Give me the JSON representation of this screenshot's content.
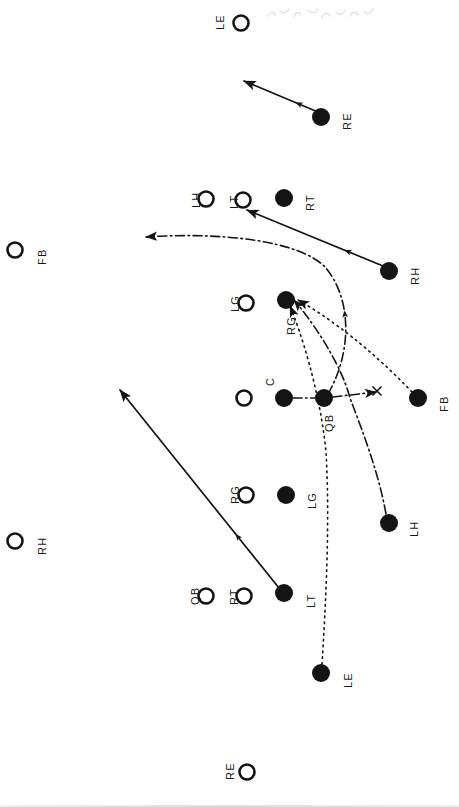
{
  "document": {
    "title": "Football Play Diagram",
    "orientation": "rotated-90",
    "background_color": "#ffffff",
    "ink_color": "#141414"
  },
  "legend": {
    "offense_marker": "filled-circle",
    "defense_marker": "open-circle"
  },
  "players": [
    {
      "id": "def-le-top",
      "label": "LE",
      "marker": "open",
      "cx": 241,
      "cy": 23,
      "r": 7.5,
      "label_x": 214,
      "label_y": 30
    },
    {
      "id": "off-re",
      "label": "RE",
      "marker": "filled",
      "cx": 321,
      "cy": 117,
      "r": 9,
      "label_x": 341,
      "label_y": 130
    },
    {
      "id": "def-lh",
      "label": "LH",
      "marker": "open",
      "cx": 206,
      "cy": 199,
      "r": 7.5,
      "label_x": 190,
      "label_y": 208
    },
    {
      "id": "def-lt",
      "label": "LT",
      "marker": "open",
      "cx": 243,
      "cy": 200,
      "r": 7.5,
      "label_x": 228,
      "label_y": 209
    },
    {
      "id": "off-rt",
      "label": "RT",
      "marker": "filled",
      "cx": 284,
      "cy": 198,
      "r": 9,
      "label_x": 304,
      "label_y": 211
    },
    {
      "id": "def-fb",
      "label": "FB",
      "marker": "open",
      "cx": 15,
      "cy": 250,
      "r": 7.5,
      "label_x": 36,
      "label_y": 265
    },
    {
      "id": "off-rh",
      "label": "RH",
      "marker": "filled",
      "cx": 389,
      "cy": 271,
      "r": 9,
      "label_x": 409,
      "label_y": 285
    },
    {
      "id": "def-lg",
      "label": "LG",
      "marker": "open",
      "cx": 246,
      "cy": 303,
      "r": 7.5,
      "label_x": 229,
      "label_y": 312
    },
    {
      "id": "off-rg",
      "label": "RG",
      "marker": "filled",
      "cx": 286,
      "cy": 300,
      "r": 9,
      "label_x": 285,
      "label_y": 335
    },
    {
      "id": "def-c",
      "label": "C",
      "marker": "open",
      "cx": 244,
      "cy": 398,
      "r": 7.5,
      "label_x": 264,
      "label_y": 386
    },
    {
      "id": "off-c",
      "label": "",
      "marker": "filled",
      "cx": 284,
      "cy": 398,
      "r": 9,
      "label_x": 0,
      "label_y": 0
    },
    {
      "id": "off-qb",
      "label": "QB",
      "marker": "filled",
      "cx": 324,
      "cy": 398,
      "r": 9,
      "label_x": 323,
      "label_y": 432
    },
    {
      "id": "off-fb",
      "label": "FB",
      "marker": "filled",
      "cx": 418,
      "cy": 398,
      "r": 9,
      "label_x": 438,
      "label_y": 412
    },
    {
      "id": "def-rh",
      "label": "RH",
      "marker": "open",
      "cx": 15,
      "cy": 541,
      "r": 7.5,
      "label_x": 36,
      "label_y": 555
    },
    {
      "id": "def-rg",
      "label": "RG",
      "marker": "open",
      "cx": 246,
      "cy": 495,
      "r": 7.5,
      "label_x": 229,
      "label_y": 504
    },
    {
      "id": "off-lg",
      "label": "LG",
      "marker": "filled",
      "cx": 286,
      "cy": 495,
      "r": 9,
      "label_x": 306,
      "label_y": 509
    },
    {
      "id": "off-lh",
      "label": "LH",
      "marker": "filled",
      "cx": 389,
      "cy": 523,
      "r": 9,
      "label_x": 408,
      "label_y": 537
    },
    {
      "id": "def-qb",
      "label": "QB",
      "marker": "open",
      "cx": 206,
      "cy": 596,
      "r": 7.5,
      "label_x": 189,
      "label_y": 605
    },
    {
      "id": "def-rt",
      "label": "RT",
      "marker": "open",
      "cx": 244,
      "cy": 596,
      "r": 7.5,
      "label_x": 228,
      "label_y": 605
    },
    {
      "id": "off-lt",
      "label": "LT",
      "marker": "filled",
      "cx": 284,
      "cy": 593,
      "r": 9,
      "label_x": 305,
      "label_y": 608
    },
    {
      "id": "off-le",
      "label": "LE",
      "marker": "filled",
      "cx": 321,
      "cy": 673,
      "r": 9,
      "label_x": 342,
      "label_y": 688
    },
    {
      "id": "def-re-bot",
      "label": "RE",
      "marker": "open",
      "cx": 247,
      "cy": 772,
      "r": 7.5,
      "label_x": 224,
      "label_y": 780
    }
  ],
  "routes": [
    {
      "id": "route-re",
      "from": "off-re",
      "style": "solid",
      "arrow": true,
      "mid_arrow": true,
      "path": "M 318 112 L 244 81",
      "desc": "RE blocks upfield left"
    },
    {
      "id": "route-rh",
      "from": "off-rh",
      "style": "solid",
      "arrow": true,
      "mid_arrow": true,
      "path": "M 383 266 L 247 210",
      "desc": "RH drives to LT gap"
    },
    {
      "id": "route-qb-sweep",
      "from": "off-qb",
      "style": "dash-dot",
      "arrow": true,
      "mid_arrow": true,
      "path": "M 328 394 C 352 352 352 300 326 268 C 300 240 220 232 146 237",
      "desc": "QB dash-dot sweep around left end"
    },
    {
      "id": "route-fb",
      "from": "off-fb",
      "style": "dotted",
      "arrow": true,
      "mid_arrow": false,
      "path": "M 412 392 C 372 350 330 318 298 300",
      "desc": "FB dotted path to RG"
    },
    {
      "id": "route-lh-pull",
      "from": "off-lh",
      "style": "dash-dot",
      "arrow": true,
      "mid_arrow": false,
      "path": "M 386 514 C 378 470 362 430 350 398 C 340 360 308 316 294 300",
      "desc": "LH pulls to RG hole"
    },
    {
      "id": "route-le",
      "from": "off-le",
      "style": "dotted",
      "arrow": true,
      "mid_arrow": false,
      "path": "M 322 664 C 326 600 330 520 326 452 C 320 390 300 330 290 306",
      "desc": "LE dotted release to RG area"
    },
    {
      "id": "route-lt",
      "from": "off-lt",
      "style": "solid",
      "arrow": true,
      "mid_arrow": true,
      "path": "M 279 588 L 120 390",
      "desc": "LT pulls long to far left"
    },
    {
      "id": "route-c",
      "from": "off-c",
      "style": "dash-dot",
      "arrow": false,
      "mid_arrow": false,
      "path": "M 293 398 L 316 398",
      "desc": "Center snap link"
    },
    {
      "id": "route-handoff",
      "from": "off-qb",
      "style": "dash-dot",
      "arrow": true,
      "mid_arrow": false,
      "path": "M 333 397 L 376 392",
      "desc": "Handoff mesh point"
    }
  ],
  "mesh_point": {
    "x": 377,
    "y": 391,
    "symbol": "x-mark"
  }
}
